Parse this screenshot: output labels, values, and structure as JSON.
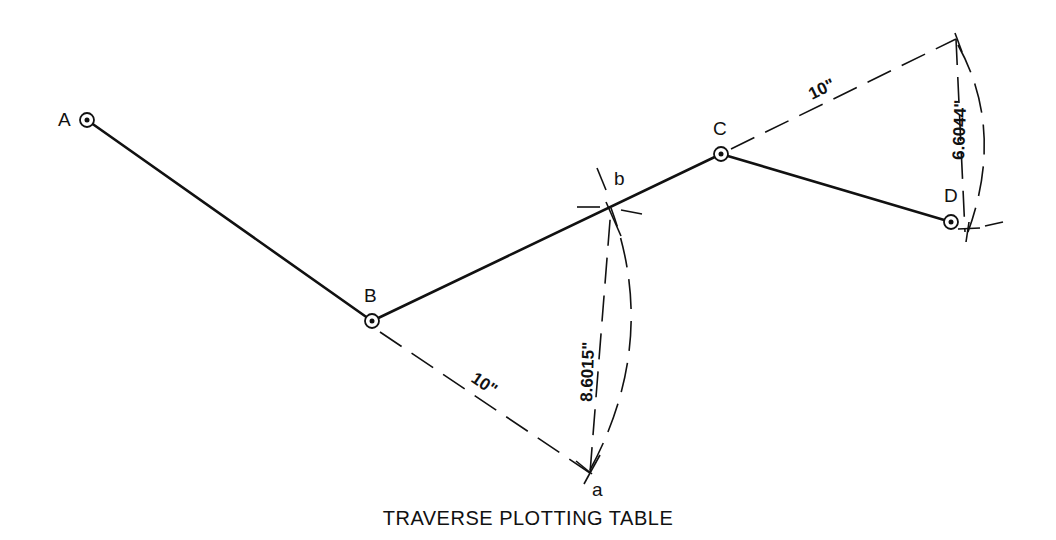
{
  "title": "TRAVERSE PLOTTING TABLE",
  "stations": [
    {
      "id": "A",
      "label": "A",
      "x": 87,
      "y": 120
    },
    {
      "id": "B",
      "label": "B",
      "x": 372,
      "y": 321
    },
    {
      "id": "C",
      "label": "C",
      "x": 721,
      "y": 154
    },
    {
      "id": "D",
      "label": "D",
      "x": 951,
      "y": 222
    }
  ],
  "construction_points": [
    {
      "id": "b",
      "label": "b",
      "x": 611,
      "y": 208
    },
    {
      "id": "a",
      "label": "a",
      "x": 590,
      "y": 473
    },
    {
      "id": "c_ext",
      "label": "",
      "x": 956,
      "y": 39
    }
  ],
  "dimensions": {
    "B_to_a": "10\"",
    "a_to_b": "8.6015\"",
    "C_to_ext": "10\"",
    "ext_to_D": "6.6044\""
  },
  "colors": {
    "ink": "#111111",
    "background": "#ffffff"
  }
}
